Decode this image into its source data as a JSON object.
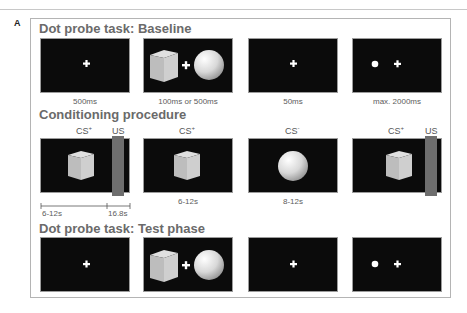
{
  "figure_label": "A",
  "sections": [
    {
      "title": "Dot probe task: Baseline",
      "panels": [
        {
          "content": "fixation-cross",
          "caption": "500ms"
        },
        {
          "content": "cube-cross-sphere",
          "caption": "100ms or 500ms"
        },
        {
          "content": "fixation-cross",
          "caption": "50ms"
        },
        {
          "content": "dot-and-cross",
          "caption": "max. 2000ms"
        }
      ]
    },
    {
      "title": "Conditioning procedure",
      "panels": [
        {
          "content": "cube-with-us",
          "label": "CS",
          "label_sup": "+",
          "us_label": "US"
        },
        {
          "content": "cube",
          "label": "CS",
          "label_sup": "+",
          "caption": "6-12s"
        },
        {
          "content": "sphere",
          "label": "CS",
          "label_sup": "-",
          "caption": "8-12s"
        },
        {
          "content": "cube-with-us",
          "label": "CS",
          "label_sup": "+",
          "us_label": "US"
        }
      ],
      "timeline": {
        "cs_duration": "6-12s",
        "us_duration": "16.8s"
      }
    },
    {
      "title": "Dot probe task: Test phase",
      "panels": [
        {
          "content": "fixation-cross"
        },
        {
          "content": "cube-cross-sphere"
        },
        {
          "content": "fixation-cross"
        },
        {
          "content": "dot-and-cross"
        }
      ]
    }
  ],
  "colors": {
    "screen_bg": "#0b0b0b",
    "us_bar": "#6e6e6e",
    "title_text": "#6a6a6a",
    "stimulus_white": "#ffffff"
  }
}
